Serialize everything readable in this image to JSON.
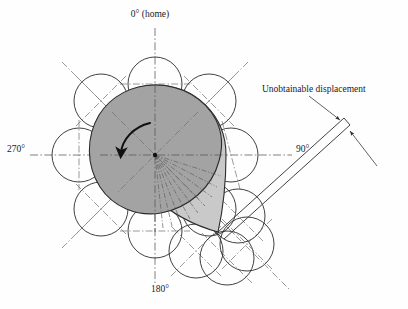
{
  "figure": {
    "background_color": "#fefefe",
    "labels": {
      "home": "0° (home)",
      "right": "90°",
      "bottom": "180°",
      "left": "270°",
      "annotation": "Unobtainable displacement"
    },
    "colors": {
      "lobe_dark": "#a3a3a3",
      "lobe_light": "#c9c9c9",
      "outline": "#2b2b2b",
      "centerline": "#6f6f6f",
      "text": "#1a1a1a"
    },
    "geometry": {
      "center": {
        "x": 155,
        "y": 155
      },
      "circle_radius": 27,
      "rotation_direction": "counterclockwise",
      "tip": {
        "x": 218,
        "y": 232
      }
    },
    "circles": [
      {
        "cx": 155,
        "cy": 84,
        "r": 27
      },
      {
        "cx": 101,
        "cy": 101,
        "r": 27
      },
      {
        "cx": 209,
        "cy": 101,
        "r": 27
      },
      {
        "cx": 79,
        "cy": 155,
        "r": 27
      },
      {
        "cx": 231,
        "cy": 155,
        "r": 27
      },
      {
        "cx": 101,
        "cy": 209,
        "r": 27
      },
      {
        "cx": 155,
        "cy": 231,
        "r": 27
      },
      {
        "cx": 209,
        "cy": 209,
        "r": 27
      },
      {
        "cx": 238,
        "cy": 216,
        "r": 27
      },
      {
        "cx": 196,
        "cy": 251,
        "r": 27
      },
      {
        "cx": 227,
        "cy": 258,
        "r": 27
      },
      {
        "cx": 247,
        "cy": 244,
        "r": 27
      }
    ],
    "fan_line_count": 9,
    "fan_angle_start_deg": 100,
    "fan_angle_end_deg": 50
  }
}
